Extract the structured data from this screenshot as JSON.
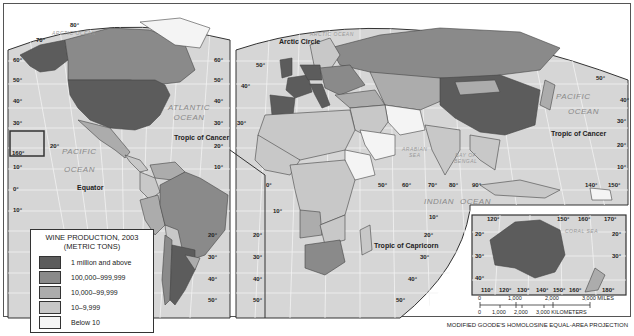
{
  "title": "WINE PRODUCTION, 2003",
  "subtitle": "(METRIC TONS)",
  "colors": {
    "ocean": "#d6d6d6",
    "grid": "#f2f2f2",
    "border": "#444444",
    "class_1": "#5c5c5c",
    "class_2": "#8a8a8a",
    "class_3": "#acacac",
    "class_4": "#c8c8c8",
    "class_5": "#f4f4f4"
  },
  "legend": {
    "items": [
      {
        "label": "1 million and above",
        "color": "#5c5c5c"
      },
      {
        "label": "100,000–999,999",
        "color": "#8a8a8a"
      },
      {
        "label": "10,000–99,999",
        "color": "#acacac"
      },
      {
        "label": "10–9,999",
        "color": "#c8c8c8"
      },
      {
        "label": "Below 10",
        "color": "#f4f4f4"
      }
    ]
  },
  "oceans": {
    "arctic_left": "ARCTIC OCEAN",
    "arctic_right": "ARCTIC OCEAN",
    "atlantic_1": "ATLANTIC",
    "atlantic_2": "OCEAN",
    "pacific_left_1": "PACIFIC",
    "pacific_left_2": "OCEAN",
    "pacific_right_1": "PACIFIC",
    "pacific_right_2": "OCEAN",
    "indian_1": "INDIAN",
    "indian_2": "OCEAN",
    "arabian_1": "ARABIAN",
    "arabian_2": "SEA",
    "bengal_1": "BAY OF",
    "bengal_2": "BENGAL",
    "coral": "CORAL SEA"
  },
  "labels": {
    "arctic_circle": "Arctic Circle",
    "tropic_cancer_left": "Tropic of Cancer",
    "tropic_cancer_right": "Tropic of Cancer",
    "tropic_capricorn": "Tropic of Capricorn",
    "equator": "Equator"
  },
  "lat_ticks": {
    "lat80": "80°",
    "lat70": "70°",
    "lat60": "60°",
    "lat50": "50°",
    "lat40": "40°",
    "lat30": "30°",
    "lat20": "20°",
    "lat10": "10°",
    "lat0": "0°",
    "lon160": "160°",
    "lon0": "0°",
    "lon50": "50°",
    "lon60": "60°",
    "lon70": "70°",
    "lon80": "80°",
    "lon90": "90°",
    "lon140": "140°",
    "lon150": "150°",
    "lon110": "110°",
    "lon120": "120°",
    "lon130": "130°",
    "lon160b": "160°",
    "lon170": "170°",
    "lon180": "180°"
  },
  "scale": {
    "miles": [
      "0",
      "1,000",
      "2,000",
      "3,000 MILES"
    ],
    "km": [
      "0",
      "1,000",
      "2,000",
      "3,000 KILOMETERS"
    ]
  },
  "projection": "MODIFIED GOODE'S HOMOLOSINE EQUAL-AREA PROJECTION"
}
